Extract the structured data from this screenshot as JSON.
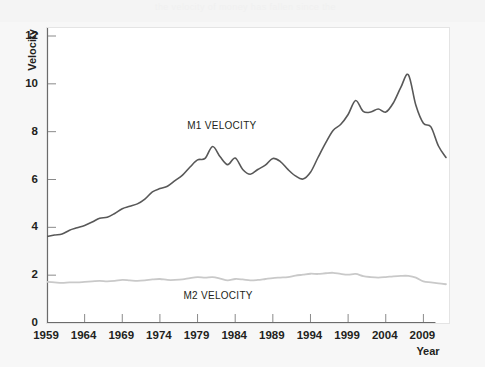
{
  "figure": {
    "background_color": "#f7f7f7",
    "plot_background_color": "#ffffff",
    "faint_header_text": "the velocity of money has fallen since the"
  },
  "chart_data": {
    "type": "line",
    "title": "",
    "subtitle": "",
    "xlabel": "Year",
    "ylabel": "Velocity",
    "xlim": [
      1959,
      2012
    ],
    "ylim": [
      0,
      12
    ],
    "grid": false,
    "legend_position": "inline-annotation",
    "xticks": [
      1959,
      1964,
      1969,
      1974,
      1979,
      1984,
      1989,
      1994,
      1999,
      2004,
      2009
    ],
    "xtick_labels": [
      "1959",
      "1964",
      "1969",
      "1974",
      "1979",
      "1984",
      "1989",
      "1994",
      "1999",
      "2004",
      "2009"
    ],
    "yticks": [
      0,
      2,
      4,
      6,
      8,
      10,
      12
    ],
    "ytick_labels": [
      "0",
      "2",
      "4",
      "6",
      "8",
      "10",
      "12"
    ],
    "annotations": [
      {
        "text": "M1 VELOCITY",
        "x": 1982.0,
        "y": 8.15,
        "series": "M1 Velocity"
      },
      {
        "text": "M2 VELOCITY",
        "x": 1981.5,
        "y": 1.05,
        "series": "M2 Velocity"
      }
    ],
    "series": [
      {
        "name": "M1 Velocity",
        "label": "M1 VELOCITY",
        "color": "#585858",
        "line_width": 1.6,
        "x": [
          1959,
          1960,
          1961,
          1962,
          1963,
          1964,
          1965,
          1966,
          1967,
          1968,
          1969,
          1970,
          1971,
          1972,
          1973,
          1974,
          1975,
          1976,
          1977,
          1978,
          1979,
          1980,
          1981,
          1982,
          1983,
          1984,
          1985,
          1986,
          1987,
          1988,
          1989,
          1990,
          1991,
          1992,
          1993,
          1994,
          1995,
          1996,
          1997,
          1998,
          1999,
          2000,
          2001,
          2002,
          2003,
          2004,
          2005,
          2006,
          2007,
          2008,
          2009,
          2010,
          2011,
          2012
        ],
        "y": [
          3.62,
          3.68,
          3.72,
          3.88,
          3.98,
          4.08,
          4.22,
          4.38,
          4.42,
          4.58,
          4.78,
          4.88,
          4.98,
          5.18,
          5.48,
          5.62,
          5.72,
          5.95,
          6.18,
          6.52,
          6.82,
          6.88,
          7.38,
          6.95,
          6.62,
          6.9,
          6.42,
          6.22,
          6.42,
          6.6,
          6.88,
          6.75,
          6.42,
          6.15,
          6.02,
          6.3,
          6.92,
          7.52,
          8.05,
          8.3,
          8.72,
          9.3,
          8.85,
          8.82,
          8.95,
          8.82,
          9.2,
          9.85,
          10.38,
          9.1,
          8.35,
          8.2,
          7.4,
          6.92
        ]
      },
      {
        "name": "M2 Velocity",
        "label": "M2 VELOCITY",
        "color": "#c9c9c9",
        "line_width": 1.8,
        "x": [
          1959,
          1960,
          1961,
          1962,
          1963,
          1964,
          1965,
          1966,
          1967,
          1968,
          1969,
          1970,
          1971,
          1972,
          1973,
          1974,
          1975,
          1976,
          1977,
          1978,
          1979,
          1980,
          1981,
          1982,
          1983,
          1984,
          1985,
          1986,
          1987,
          1988,
          1989,
          1990,
          1991,
          1992,
          1993,
          1994,
          1995,
          1996,
          1997,
          1998,
          1999,
          2000,
          2001,
          2002,
          2003,
          2004,
          2005,
          2006,
          2007,
          2008,
          2009,
          2010,
          2011,
          2012
        ],
        "y": [
          1.72,
          1.7,
          1.68,
          1.7,
          1.7,
          1.72,
          1.74,
          1.76,
          1.74,
          1.76,
          1.8,
          1.78,
          1.76,
          1.78,
          1.82,
          1.84,
          1.8,
          1.8,
          1.82,
          1.88,
          1.92,
          1.9,
          1.92,
          1.86,
          1.78,
          1.84,
          1.82,
          1.78,
          1.8,
          1.84,
          1.88,
          1.9,
          1.92,
          1.98,
          2.02,
          2.06,
          2.05,
          2.08,
          2.1,
          2.05,
          2.02,
          2.05,
          1.96,
          1.92,
          1.9,
          1.92,
          1.95,
          1.97,
          1.97,
          1.9,
          1.74,
          1.7,
          1.66,
          1.62
        ]
      }
    ]
  }
}
